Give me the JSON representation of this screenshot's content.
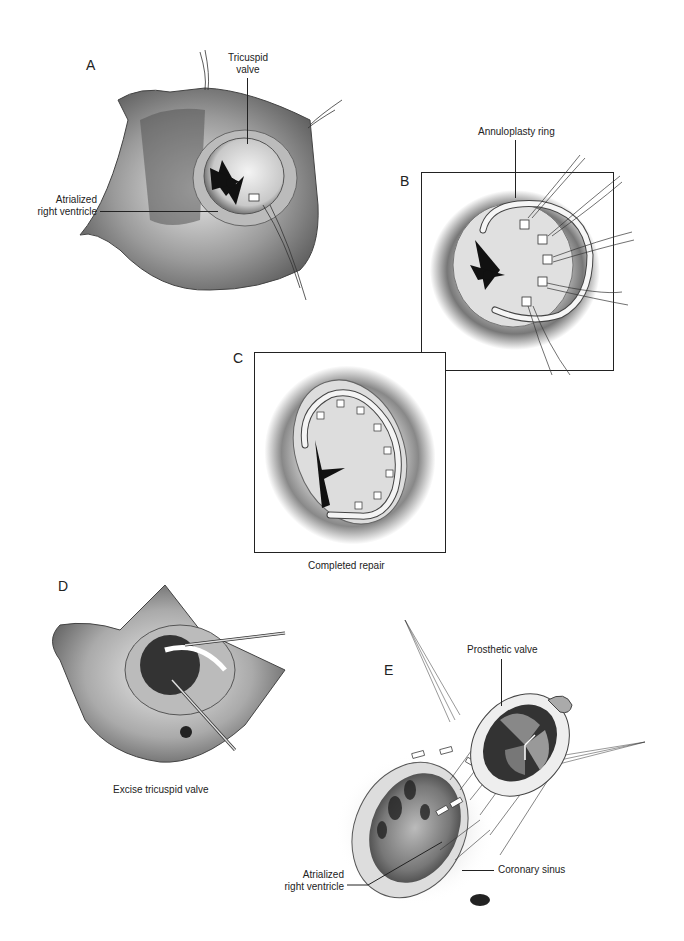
{
  "figure": {
    "panels": [
      {
        "id": "A",
        "letter": "A",
        "labels": {
          "top": "Tricuspid valve",
          "left": "Atrialized right ventricle"
        }
      },
      {
        "id": "B",
        "letter": "B",
        "labels": {
          "top": "Annuloplasty ring"
        }
      },
      {
        "id": "C",
        "letter": "C",
        "caption": "Completed repair"
      },
      {
        "id": "D",
        "letter": "D",
        "caption": "Excise tricuspid valve"
      },
      {
        "id": "E",
        "letter": "E",
        "labels": {
          "top": "Prosthetic valve",
          "left": "Atrialized right ventricle",
          "right": "Coronary sinus"
        }
      }
    ]
  },
  "text": {
    "A_letter": "A",
    "A_tricuspid_1": "Tricuspid",
    "A_tricuspid_2": "valve",
    "A_atrialized_1": "Atrialized",
    "A_atrialized_2": "right ventricle",
    "B_letter": "B",
    "B_ring": "Annuloplasty ring",
    "C_letter": "C",
    "C_caption": "Completed repair",
    "D_letter": "D",
    "D_caption": "Excise tricuspid valve",
    "E_letter": "E",
    "E_prosthetic": "Prosthetic valve",
    "E_atrialized_1": "Atrialized",
    "E_atrialized_2": "right ventricle",
    "E_coronary": "Coronary sinus"
  }
}
